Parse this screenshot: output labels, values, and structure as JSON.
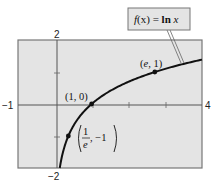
{
  "chart_data": {
    "type": "line",
    "title": "",
    "function_label": "f(x) = ln x",
    "function_label_parts": {
      "f": "f",
      "x_arg": "(x)",
      "eq": " = ",
      "ln": "ln ",
      "x": "x"
    },
    "xlabel": "",
    "ylabel": "",
    "xlim": [
      -1,
      4
    ],
    "ylim": [
      -2,
      2
    ],
    "x_ticks": [
      0,
      1,
      2,
      3,
      4
    ],
    "y_ticks": [
      -2,
      -1,
      0,
      1,
      2
    ],
    "tick_labels": {
      "x_min": "−1",
      "x_max": "4",
      "y_max": "2",
      "y_min": "−2"
    },
    "grid": false,
    "background": "#e4e4e4",
    "line_color": "#111111",
    "series": [
      {
        "name": "f(x) = ln x",
        "x": [
          0.1353,
          0.2,
          0.3679,
          0.5,
          0.75,
          1,
          1.5,
          2,
          2.5,
          2.7183,
          3,
          3.5,
          4
        ],
        "y": [
          -2,
          -1.609,
          -1,
          -0.693,
          -0.288,
          0,
          0.405,
          0.693,
          0.916,
          1,
          1.099,
          1.253,
          1.386
        ]
      }
    ],
    "points": [
      {
        "x": 0.3679,
        "y": -1,
        "label_num": "1",
        "label_den": "e",
        "label_rest": ", −1",
        "label": "(1/e, −1)"
      },
      {
        "x": 1,
        "y": 0,
        "label": "(1, 0)"
      },
      {
        "x": 2.7183,
        "y": 1,
        "label": "(e, 1)",
        "label_e": "e",
        "label_rest": ", 1)"
      }
    ]
  }
}
